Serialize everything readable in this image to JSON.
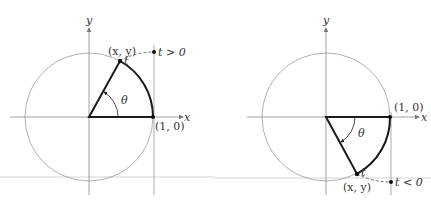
{
  "figures": [
    {
      "id": "positive",
      "axis_x_label": "x",
      "axis_y_label": "y",
      "point_label": "(x, y)",
      "unit_point_label": "(1, 0)",
      "angle_label": "θ",
      "arc_label": "t",
      "t_condition": "t > 0"
    },
    {
      "id": "negative",
      "axis_x_label": "x",
      "axis_y_label": "y",
      "point_label": "(x, y)",
      "unit_point_label": "(1, 0)",
      "angle_label": "θ",
      "arc_label": "t",
      "t_condition": "t < 0"
    }
  ],
  "colors": {
    "axis": "#8a8a8a",
    "circle": "#9a9a9a",
    "sector": "#1a1a1a",
    "text": "#333333"
  }
}
